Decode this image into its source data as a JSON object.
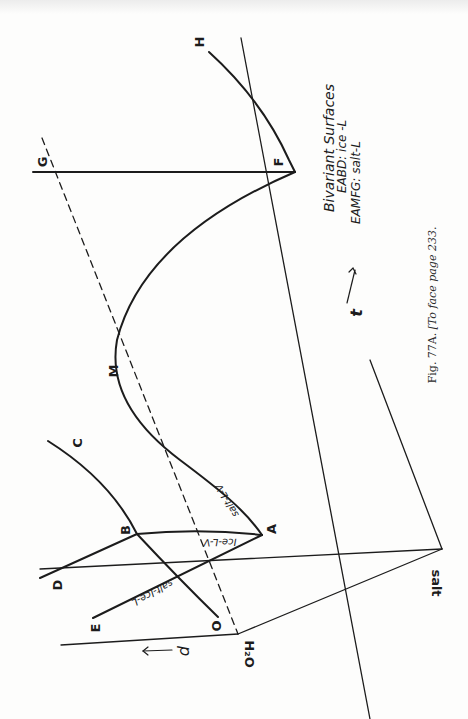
{
  "figure": {
    "caption_fig": "Fig. 77A.",
    "caption_note": "[To face page 233.",
    "orientation": "rotated 90° clockwise on page"
  },
  "axes": {
    "pressure_label": "p",
    "temperature_label": "t",
    "vertex_water": "H₂O",
    "vertex_salt": "salt"
  },
  "points": {
    "A": "A",
    "B": "B",
    "C": "C",
    "D": "D",
    "E": "E",
    "F": "F",
    "G": "G",
    "H": "H",
    "M": "M",
    "O": "O"
  },
  "curve_labels": {
    "salt_l_v": "salt-L-V",
    "ice_l_v": "Ice-L-V",
    "salt_ice_l": "salt-Ice-L"
  },
  "legend": {
    "title": "Bivariant Surfaces",
    "line1": "EABD: ice -L",
    "line2": "EAMFG: salt-L"
  },
  "colors": {
    "ink": "#1c1c1c",
    "paper": "#fdfdfc"
  }
}
